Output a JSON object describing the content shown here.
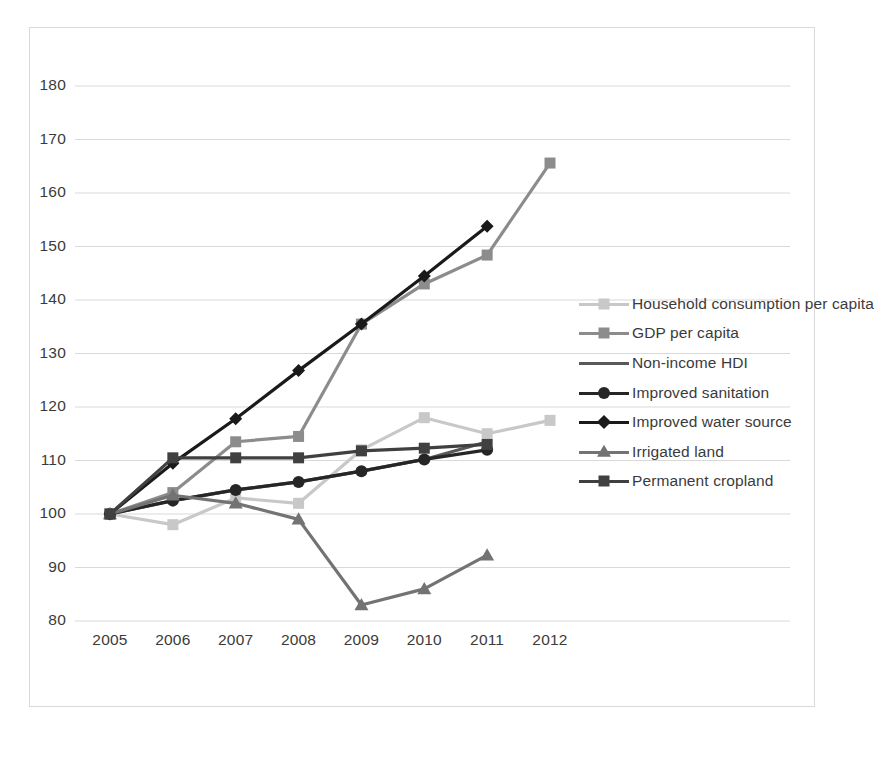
{
  "chart_data": {
    "type": "line",
    "title": "",
    "subtitle": "",
    "xlabel": "",
    "ylabel": "",
    "categories": [
      "2005",
      "2006",
      "2007",
      "2008",
      "2009",
      "2010",
      "2011",
      "2012"
    ],
    "x": [
      2005,
      2006,
      2007,
      2008,
      2009,
      2010,
      2011,
      2012
    ],
    "xlim": [
      2005,
      2012
    ],
    "ylim": [
      80,
      180
    ],
    "yticks": [
      80,
      90,
      100,
      110,
      120,
      130,
      140,
      150,
      160,
      170,
      180
    ],
    "grid": true,
    "legend_position": "right",
    "series": [
      {
        "name": "Household consumption per capita",
        "color": "#c8c8c8",
        "marker": "square",
        "values": [
          100,
          98,
          103,
          102,
          112,
          118,
          115,
          117.5
        ]
      },
      {
        "name": "GDP per capita",
        "color": "#8c8c8c",
        "marker": "square",
        "values": [
          100,
          104,
          113.5,
          114.5,
          135.5,
          143,
          148.4,
          165.6
        ]
      },
      {
        "name": "Non-income HDI",
        "color": "#595959",
        "marker": "none",
        "values": [
          100,
          102.5,
          104.5,
          106,
          108,
          110.2,
          113.5,
          null
        ]
      },
      {
        "name": "Improved sanitation",
        "color": "#262626",
        "marker": "circle",
        "values": [
          100,
          102.5,
          104.5,
          106,
          108,
          110.2,
          112,
          null
        ]
      },
      {
        "name": "Improved water source",
        "color": "#1a1a1a",
        "marker": "diamond",
        "values": [
          100,
          109.5,
          117.8,
          126.8,
          135.5,
          144.5,
          153.8,
          null
        ]
      },
      {
        "name": "Irrigated land",
        "color": "#737373",
        "marker": "triangle",
        "values": [
          100,
          103.5,
          102,
          99,
          83,
          86,
          92.3,
          null
        ]
      },
      {
        "name": "Permanent cropland",
        "color": "#404040",
        "marker": "square",
        "values": [
          100,
          110.5,
          110.5,
          110.5,
          111.8,
          112.3,
          113,
          null
        ]
      }
    ]
  },
  "axes": {
    "y_tick_labels": [
      "180",
      "170",
      "160",
      "150",
      "140",
      "130",
      "120",
      "110",
      "100",
      "90",
      "80"
    ],
    "x_tick_labels": [
      "2005",
      "2006",
      "2007",
      "2008",
      "2009",
      "2010",
      "2011",
      "2012"
    ]
  },
  "legend": {
    "items": [
      {
        "label": "Household consumption per capita"
      },
      {
        "label": "GDP per capita"
      },
      {
        "label": "Non-income HDI"
      },
      {
        "label": "Improved sanitation"
      },
      {
        "label": "Improved water source"
      },
      {
        "label": "Irrigated land"
      },
      {
        "label": "Permanent cropland"
      }
    ]
  },
  "style": {
    "background": "#ffffff",
    "grid_color": "#d9d9d9",
    "text_color": "#3b3b3b",
    "frame_color": "#d9d9d9"
  }
}
